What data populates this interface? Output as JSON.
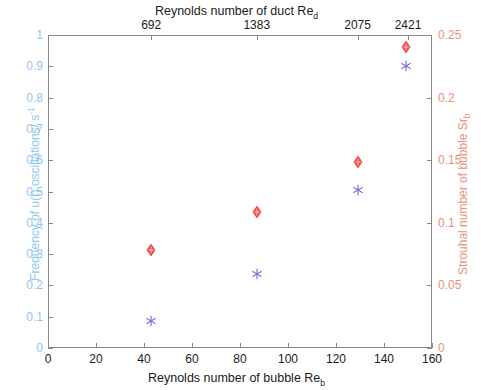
{
  "chart_data": {
    "type": "scatter",
    "title": "",
    "axes": {
      "bottom": {
        "label": "Reynolds number of bubble Re",
        "label_sub": "b",
        "ticks": [
          0,
          20,
          40,
          60,
          80,
          100,
          120,
          140,
          160
        ],
        "lim": [
          0,
          160
        ],
        "color": "#1a1a1a"
      },
      "top": {
        "label": "Reynolds number of duct Re",
        "label_sub": "d",
        "ticks": [
          692,
          1383,
          2075,
          2421
        ],
        "tick_positions_in_reb": [
          43,
          87,
          129,
          150
        ],
        "lim": [
          0,
          160
        ],
        "color": "#1a1a1a"
      },
      "left": {
        "label": "Frequency of u(t) oscillations/ s",
        "label_sup": "-1",
        "ticks": [
          0,
          0.1,
          0.2,
          0.3,
          0.4,
          0.5,
          0.6,
          0.7,
          0.8,
          0.9,
          1
        ],
        "tick_labels": [
          "0",
          "0.1",
          "0.2",
          "0.3",
          "0.4",
          "0.5",
          "0.6",
          "0.7",
          "0.8",
          "0.9",
          "1"
        ],
        "lim": [
          0,
          1
        ],
        "color": "#8fc7ef"
      },
      "right": {
        "label": "Strouhal number of bubble Sr",
        "label_sub": "b",
        "ticks": [
          0,
          0.05,
          0.1,
          0.15,
          0.2,
          0.25
        ],
        "tick_labels": [
          "0",
          "0.05",
          "0.1",
          "0.15",
          "0.2",
          "0.25"
        ],
        "lim": [
          0,
          0.25
        ],
        "color": "#e8927c"
      }
    },
    "grid": false,
    "legend": null,
    "series": [
      {
        "name": "Strouhal number of bubble",
        "marker": "filled-diamond",
        "color": "#ef4b4b",
        "axis": "right",
        "x": [
          43,
          87,
          129,
          149
        ],
        "values": [
          0.08,
          0.11,
          0.15,
          0.242
        ]
      },
      {
        "name": "Frequency of u(t) oscillations",
        "marker": "asterisk",
        "color": "#7b74d6",
        "axis": "left",
        "x": [
          43,
          87,
          129,
          149
        ],
        "values": [
          0.095,
          0.245,
          0.515,
          0.91
        ]
      }
    ]
  }
}
